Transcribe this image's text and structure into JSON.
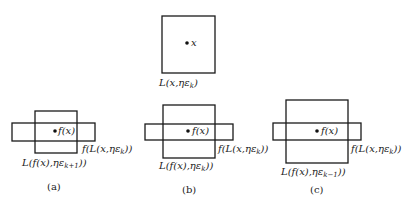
{
  "diagram": {
    "top": {
      "point_label": "x",
      "box_label_main": "L(x,ηε",
      "box_label_sub": "k",
      "box_label_end": ")",
      "box": {
        "x": 162,
        "y": 16,
        "w": 53,
        "h": 57
      },
      "dot": {
        "x": 187,
        "y": 43
      }
    },
    "panels": [
      {
        "id": "a",
        "caption": "(a)",
        "point_label": "f(x)",
        "image_label_main": "f(L(x,ηε",
        "image_label_sub": "k",
        "image_label_end": "))",
        "ball_label_main": "L(f(x),ηε",
        "ball_label_sub": "k+1",
        "ball_label_end": "))",
        "vbox": {
          "x": 35,
          "y": 111,
          "w": 42,
          "h": 42
        },
        "hbox": {
          "x": 12,
          "y": 123,
          "w": 83,
          "h": 18
        },
        "dot": {
          "x": 55,
          "y": 131
        }
      },
      {
        "id": "b",
        "caption": "(b)",
        "point_label": "f(x)",
        "image_label_main": "f(L(x,ηε",
        "image_label_sub": "k",
        "image_label_end": "))",
        "ball_label_main": "L(f(x),ηε",
        "ball_label_sub": "k",
        "ball_label_end": "))",
        "vbox": {
          "x": 163,
          "y": 105,
          "w": 52,
          "h": 53
        },
        "hbox": {
          "x": 145,
          "y": 124,
          "w": 88,
          "h": 16
        },
        "dot": {
          "x": 188,
          "y": 131
        }
      },
      {
        "id": "c",
        "caption": "(c)",
        "point_label": "f(x)",
        "image_label_main": "f(L(x,ηε",
        "image_label_sub": "k",
        "image_label_end": "))",
        "ball_label_main": "L(f(x),ηε",
        "ball_label_sub": "k−1",
        "ball_label_end": "))",
        "vbox": {
          "x": 286,
          "y": 100,
          "w": 62,
          "h": 63
        },
        "hbox": {
          "x": 273,
          "y": 123,
          "w": 88,
          "h": 17
        },
        "dot": {
          "x": 317,
          "y": 131
        }
      }
    ]
  }
}
